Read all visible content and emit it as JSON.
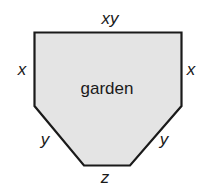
{
  "diagram": {
    "shape": "hexagon",
    "fill_color": "#e4e4e4",
    "stroke_color": "#1a1a1a",
    "region_label": "garden",
    "side_labels": {
      "top": "xy",
      "left": "x",
      "right": "x",
      "lower_left": "y",
      "lower_right": "y",
      "bottom": "z"
    }
  }
}
